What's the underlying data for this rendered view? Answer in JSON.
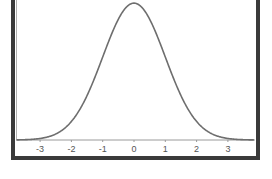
{
  "chart_data": {
    "type": "line",
    "title": "",
    "xlabel": "",
    "ylabel": "",
    "series": [
      {
        "name": "Standard normal density",
        "mean": 0,
        "sd": 1,
        "x": [
          -3.5,
          -3,
          -2.5,
          -2,
          -1.5,
          -1,
          -0.5,
          0,
          0.5,
          1,
          1.5,
          2,
          2.5,
          3,
          3.5
        ],
        "values": [
          0.0009,
          0.0044,
          0.0175,
          0.054,
          0.1295,
          0.242,
          0.3521,
          0.3989,
          0.3521,
          0.242,
          0.1295,
          0.054,
          0.0175,
          0.0044,
          0.0009
        ]
      }
    ],
    "x_ticks": [
      "-3",
      "-2",
      "-1",
      "0",
      "1",
      "2",
      "3"
    ],
    "xlim": [
      -3.75,
      3.85
    ],
    "grid": false,
    "legend": null
  },
  "colors": {
    "frame": "#3a3a3a",
    "curve": "#6e6e6e",
    "axis": "#9a9a9a",
    "background": "#ffffff"
  }
}
